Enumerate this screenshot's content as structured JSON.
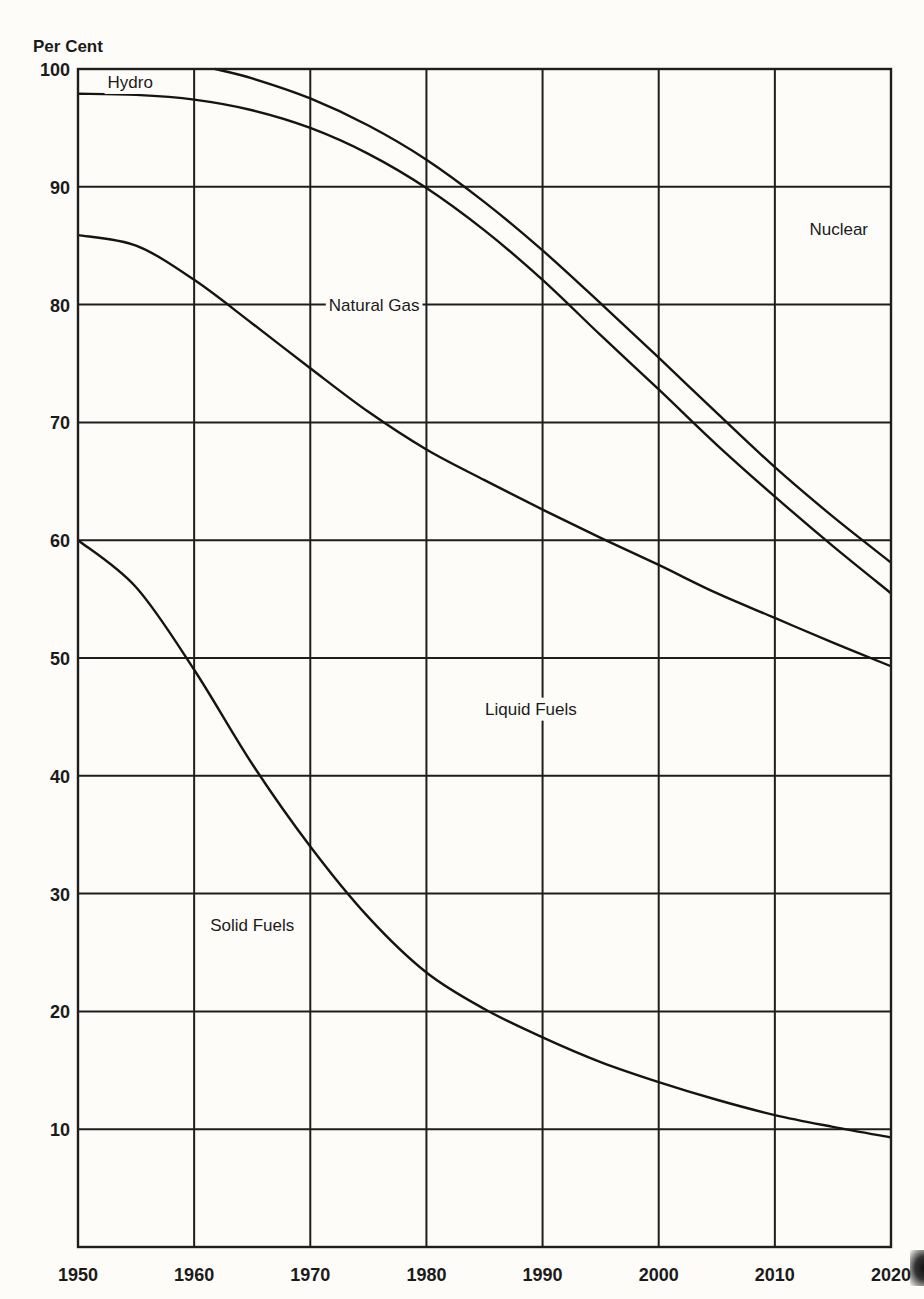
{
  "chart_data": {
    "type": "area",
    "stacked": true,
    "title": "",
    "ylabel": "Per Cent",
    "xlabel": "",
    "xlim": [
      1950,
      2020
    ],
    "ylim": [
      0,
      100
    ],
    "grid": true,
    "legend": "inline region labels",
    "x_ticks": [
      1950,
      1960,
      1970,
      1980,
      1990,
      2000,
      2010,
      2020
    ],
    "x_tick_labels": [
      "1950",
      "1960",
      "1970",
      "1980",
      "1990",
      "2000",
      "2010",
      "2020"
    ],
    "y_ticks": [
      10,
      20,
      30,
      40,
      50,
      60,
      70,
      80,
      90,
      100
    ],
    "y_tick_labels": [
      "10",
      "20",
      "30",
      "40",
      "50",
      "60",
      "70",
      "80",
      "90",
      "100"
    ],
    "boundaries": [
      {
        "name": "Solid Fuels upper boundary",
        "x": [
          1950,
          1955,
          1960,
          1965,
          1970,
          1975,
          1980,
          1985,
          1990,
          1995,
          2000,
          2005,
          2010,
          2015,
          2020
        ],
        "y": [
          60,
          56,
          49,
          41,
          34,
          28,
          23.3,
          20.2,
          17.8,
          15.7,
          14.0,
          12.5,
          11.2,
          10.2,
          9.3
        ]
      },
      {
        "name": "Liquid Fuels upper boundary",
        "x": [
          1950,
          1955,
          1960,
          1965,
          1970,
          1975,
          1980,
          1985,
          1990,
          1995,
          2000,
          2005,
          2010,
          2015,
          2020
        ],
        "y": [
          85.9,
          85.0,
          82.1,
          78.4,
          74.6,
          70.9,
          67.7,
          65.1,
          62.6,
          60.2,
          57.9,
          55.5,
          53.4,
          51.3,
          49.3
        ]
      },
      {
        "name": "Natural Gas upper boundary",
        "x": [
          1950,
          1955,
          1960,
          1965,
          1970,
          1975,
          1980,
          1985,
          1990,
          1995,
          2000,
          2005,
          2010,
          2015,
          2020
        ],
        "y": [
          97.9,
          97.8,
          97.4,
          96.5,
          95.0,
          92.8,
          89.9,
          86.3,
          82.1,
          77.4,
          72.8,
          68.1,
          63.7,
          59.5,
          55.5
        ]
      },
      {
        "name": "Hydro upper boundary",
        "x": [
          1961.8,
          1965,
          1970,
          1975,
          1980,
          1985,
          1990,
          1995,
          2000,
          2005,
          2010,
          2015,
          2020
        ],
        "y": [
          100,
          99.2,
          97.5,
          95.2,
          92.3,
          88.7,
          84.6,
          80.1,
          75.5,
          70.8,
          66.2,
          62.0,
          58.1
        ]
      }
    ],
    "series": [
      {
        "name": "Solid Fuels",
        "x": [
          1950,
          1960,
          1970,
          1980,
          1990,
          2000,
          2010,
          2020
        ],
        "values": [
          60,
          49,
          34,
          23.3,
          17.8,
          14.0,
          11.2,
          9.3
        ]
      },
      {
        "name": "Liquid Fuels",
        "x": [
          1950,
          1960,
          1970,
          1980,
          1990,
          2000,
          2010,
          2020
        ],
        "values": [
          25.9,
          33.1,
          40.6,
          44.4,
          44.8,
          43.9,
          42.2,
          40.0
        ]
      },
      {
        "name": "Natural Gas",
        "x": [
          1950,
          1960,
          1970,
          1980,
          1990,
          2000,
          2010,
          2020
        ],
        "values": [
          12.0,
          15.3,
          20.4,
          22.2,
          19.5,
          14.9,
          10.3,
          6.2
        ]
      },
      {
        "name": "Hydro",
        "x": [
          1950,
          1960,
          1970,
          1980,
          1990,
          2000,
          2010,
          2020
        ],
        "values": [
          2.1,
          2.6,
          2.5,
          2.4,
          2.5,
          2.7,
          2.5,
          2.6
        ]
      },
      {
        "name": "Nuclear",
        "x": [
          1950,
          1960,
          1970,
          1980,
          1990,
          2000,
          2010,
          2020
        ],
        "values": [
          0,
          0,
          2.5,
          7.7,
          15.4,
          24.5,
          33.8,
          41.9
        ]
      }
    ],
    "region_labels": [
      {
        "text": "Hydro",
        "x": 1954.5,
        "y": 98.9
      },
      {
        "text": "Natural Gas",
        "x": 1975.5,
        "y": 80
      },
      {
        "text": "Nuclear",
        "x": 2015.5,
        "y": 86.4
      },
      {
        "text": "Liquid Fuels",
        "x": 1989,
        "y": 45.7
      },
      {
        "text": "Solid Fuels",
        "x": 1965,
        "y": 27.3
      }
    ]
  },
  "colors": {
    "background": "#fdfcf8",
    "ink": "#1b1b1b"
  },
  "layout": {
    "plot_left": 78,
    "plot_right": 891,
    "plot_top": 69,
    "plot_bottom": 1247
  }
}
